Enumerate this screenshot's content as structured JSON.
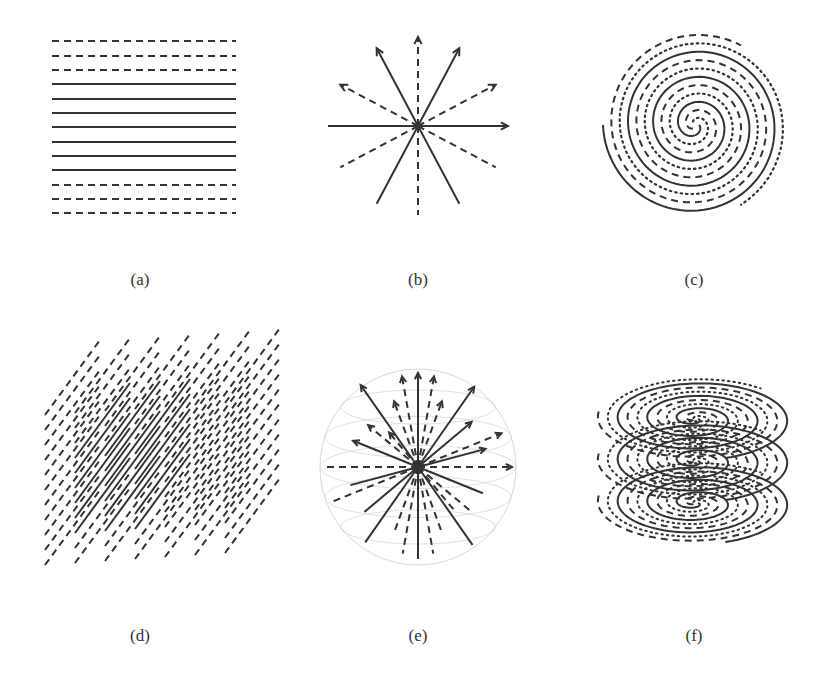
{
  "figure": {
    "panels": [
      {
        "id": "a",
        "label": "(a)",
        "description": "parallel horizontal lines: 3 dashed, 7 solid, 3 dashed"
      },
      {
        "id": "b",
        "label": "(b)",
        "description": "radial lines from a center, alternating solid and dashed, arrowheads on upper half"
      },
      {
        "id": "c",
        "label": "(c)",
        "description": "interleaved spiral with solid, dashed and dotted strands"
      },
      {
        "id": "d",
        "label": "(d)",
        "description": "3D stack of parallel oblique line segments, solid core surrounded by dashed"
      },
      {
        "id": "e",
        "label": "(e)",
        "description": "3D radial star inside a faint sphere, solid and dashed rays with arrowheads"
      },
      {
        "id": "f",
        "label": "(f)",
        "description": "three stacked spiral layers with solid, dashed and dotted strands"
      }
    ]
  },
  "colors": {
    "ink": "#333333",
    "faint": "#d8d8d8",
    "background": "#ffffff"
  }
}
